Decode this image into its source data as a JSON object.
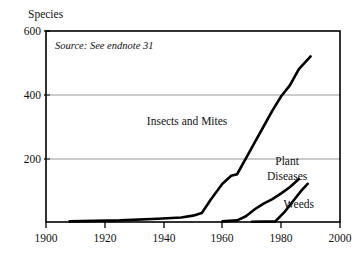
{
  "chart_data": {
    "type": "line",
    "title": "",
    "ylabel": "Species",
    "xlabel": "",
    "source_note": "Source: See endnote 31",
    "xlim": [
      1900,
      2000
    ],
    "ylim": [
      0,
      600
    ],
    "xticks": [
      1900,
      1920,
      1940,
      1960,
      1980,
      2000
    ],
    "xtick_labels": [
      "1900",
      "1920",
      "1940",
      "1960",
      "1980",
      "2000"
    ],
    "yticks": [
      200,
      400,
      600
    ],
    "ytick_labels": [
      "200",
      "400",
      "600"
    ],
    "grid": "horizontal-at-200-and-400",
    "legend_position": "inline-labels",
    "series": [
      {
        "name": "Insects and Mites",
        "label": "Insects and Mites",
        "label_x": 1948,
        "label_y": 305,
        "x": [
          1908,
          1925,
          1938,
          1946,
          1950,
          1953,
          1956,
          1960,
          1963,
          1965,
          1968,
          1971,
          1974,
          1977,
          1980,
          1983,
          1986,
          1990
        ],
        "values": [
          2,
          5,
          10,
          14,
          20,
          28,
          70,
          120,
          145,
          150,
          200,
          250,
          300,
          350,
          395,
          430,
          480,
          520
        ]
      },
      {
        "name": "Plant Diseases",
        "label": "Plant Diseases",
        "label_x": 1982,
        "label_y": 180,
        "x": [
          1960,
          1965,
          1968,
          1971,
          1974,
          1977,
          1980,
          1983,
          1986
        ],
        "values": [
          2,
          5,
          18,
          40,
          58,
          72,
          90,
          110,
          135
        ]
      },
      {
        "name": "Weeds",
        "label": "Weeds",
        "label_x": 1986,
        "label_y": 45,
        "x": [
          1970,
          1978,
          1981,
          1984,
          1987,
          1989
        ],
        "values": [
          1,
          2,
          30,
          65,
          100,
          120
        ]
      }
    ]
  }
}
